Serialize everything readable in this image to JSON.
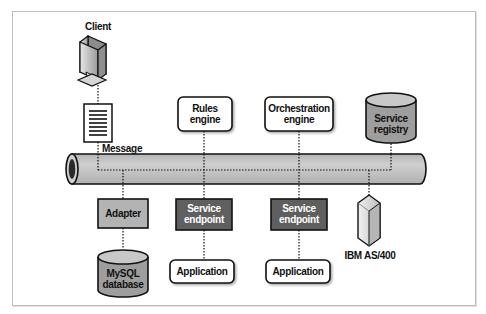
{
  "diagram": {
    "type": "enterprise-service-bus",
    "nodes": {
      "client": {
        "label": "Client",
        "icon": "monitor-icon"
      },
      "message": {
        "label": "Message",
        "icon": "document-icon"
      },
      "rules_engine": {
        "label": "Rules engine"
      },
      "orchestration_engine": {
        "label": "Orchestration engine"
      },
      "service_registry": {
        "label": "Service registry",
        "icon": "database-cylinder-icon"
      },
      "adapter": {
        "label": "Adapter"
      },
      "service_endpoint_1": {
        "label": "Service endpoint"
      },
      "service_endpoint_2": {
        "label": "Service endpoint"
      },
      "ibm_as400": {
        "label": "IBM AS/400",
        "icon": "server-tower-icon"
      },
      "mysql_database": {
        "label": "MySQL database",
        "icon": "database-cylinder-icon"
      },
      "application_1": {
        "label": "Application"
      },
      "application_2": {
        "label": "Application"
      }
    },
    "labels": {
      "client": "Client",
      "message": "Message",
      "rules_line1": "Rules",
      "rules_line2": "engine",
      "orch_line1": "Orchestration",
      "orch_line2": "engine",
      "registry_line1": "Service",
      "registry_line2": "registry",
      "adapter": "Adapter",
      "endpoint1_line1": "Service",
      "endpoint1_line2": "endpoint",
      "endpoint2_line1": "Service",
      "endpoint2_line2": "endpoint",
      "ibm": "IBM AS/400",
      "mysql_line1": "MySQL",
      "mysql_line2": "database",
      "application1": "Application",
      "application2": "Application"
    },
    "edges": [
      [
        "client",
        "message"
      ],
      [
        "message",
        "bus"
      ],
      [
        "rules_engine",
        "bus"
      ],
      [
        "orchestration_engine",
        "bus"
      ],
      [
        "service_registry",
        "bus"
      ],
      [
        "bus",
        "adapter"
      ],
      [
        "bus",
        "service_endpoint_1"
      ],
      [
        "bus",
        "service_endpoint_2"
      ],
      [
        "bus",
        "ibm_as400"
      ],
      [
        "adapter",
        "mysql_database"
      ],
      [
        "service_endpoint_1",
        "application_1"
      ],
      [
        "service_endpoint_2",
        "application_2"
      ]
    ],
    "colors": {
      "bus_fill": "#c4c4c4",
      "adapter_fill": "#b3b3b3",
      "endpoint_fill": "#5f5f5f",
      "cylinder_fill": "#9e9e9e",
      "stroke": "#111111"
    }
  }
}
